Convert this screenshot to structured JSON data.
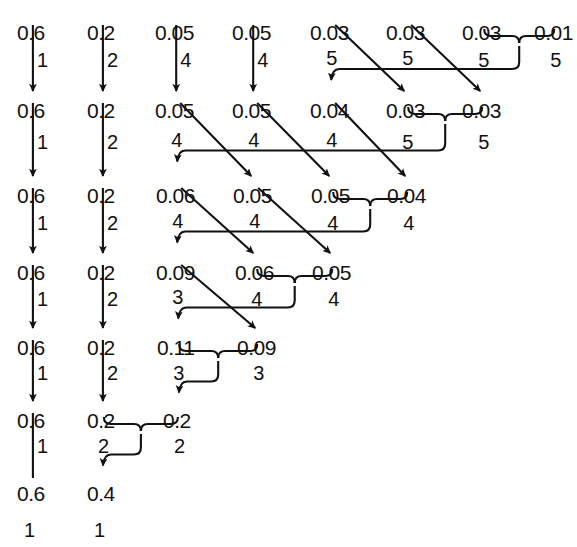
{
  "diagram": {
    "type": "huffman-reduction",
    "background": "#ffffff",
    "ink": "#111111",
    "width": 577,
    "height": 547
  },
  "chart_data": {
    "type": "diagram",
    "row_y": [
      22,
      100,
      185,
      262,
      337,
      410,
      483
    ],
    "rows": [
      {
        "index": 0,
        "y": 22,
        "values": [
          "0.6",
          "0.2",
          "0.05",
          "0.05",
          "0.03",
          "0.03",
          "0.03",
          "0.01"
        ],
        "x": [
          17,
          87,
          155,
          232,
          310,
          386,
          462,
          534
        ]
      },
      {
        "index": 1,
        "y": 100,
        "values": [
          "0.6",
          "0.2",
          "0.05",
          "0.05",
          "0.04",
          "0.03",
          "0.03"
        ],
        "x": [
          17,
          87,
          155,
          232,
          310,
          386,
          462
        ]
      },
      {
        "index": 2,
        "y": 185,
        "values": [
          "0.6",
          "0.2",
          "0.06",
          "0.05",
          "0.05",
          "0.04"
        ],
        "x": [
          17,
          87,
          156,
          233,
          311,
          387
        ]
      },
      {
        "index": 3,
        "y": 262,
        "values": [
          "0.6",
          "0.2",
          "0.09",
          "0.06",
          "0.05"
        ],
        "x": [
          17,
          87,
          156,
          235,
          312
        ]
      },
      {
        "index": 4,
        "y": 337,
        "values": [
          "0.6",
          "0.2",
          "0.11",
          "0.09"
        ],
        "x": [
          17,
          87,
          157,
          237
        ]
      },
      {
        "index": 5,
        "y": 410,
        "values": [
          "0.6",
          "0.2",
          "0.2"
        ],
        "x": [
          17,
          87,
          163
        ]
      },
      {
        "index": 6,
        "y": 483,
        "values": [
          "0.6",
          "0.4"
        ],
        "x": [
          17,
          87
        ]
      }
    ],
    "transitions": [
      {
        "from_row": 0,
        "to_row": 1,
        "straight_arrows": [
          {
            "column": 0,
            "label": "1"
          },
          {
            "column": 1,
            "label": "2"
          },
          {
            "column": 2,
            "label": "4"
          },
          {
            "column": 3,
            "label": "4"
          }
        ],
        "diagonal_arrows": [
          {
            "from_column": 4,
            "to_column": 5,
            "label": "5"
          },
          {
            "from_column": 5,
            "to_column": 6,
            "label": "5"
          }
        ],
        "merge": {
          "columns": [
            6,
            7
          ],
          "labels": [
            "5",
            "5"
          ],
          "target_column": 4
        }
      },
      {
        "from_row": 1,
        "to_row": 2,
        "straight_arrows": [
          {
            "column": 0,
            "label": "1"
          },
          {
            "column": 1,
            "label": "2"
          }
        ],
        "diagonal_arrows": [
          {
            "from_column": 2,
            "to_column": 3,
            "label": "4"
          },
          {
            "from_column": 3,
            "to_column": 4,
            "label": "4"
          },
          {
            "from_column": 4,
            "to_column": 5,
            "label": "4"
          }
        ],
        "merge": {
          "columns": [
            5,
            6
          ],
          "labels": [
            "5",
            "5"
          ],
          "target_column": 2
        }
      },
      {
        "from_row": 2,
        "to_row": 3,
        "straight_arrows": [
          {
            "column": 0,
            "label": "1"
          },
          {
            "column": 1,
            "label": "2"
          }
        ],
        "diagonal_arrows": [
          {
            "from_column": 2,
            "to_column": 3,
            "label": "4"
          },
          {
            "from_column": 3,
            "to_column": 4,
            "label": "4"
          }
        ],
        "merge": {
          "columns": [
            4,
            5
          ],
          "labels": [
            "4",
            "4"
          ],
          "target_column": 2
        }
      },
      {
        "from_row": 3,
        "to_row": 4,
        "straight_arrows": [
          {
            "column": 0,
            "label": "1"
          },
          {
            "column": 1,
            "label": "2"
          }
        ],
        "diagonal_arrows": [
          {
            "from_column": 2,
            "to_column": 3,
            "label": "3"
          }
        ],
        "merge": {
          "columns": [
            3,
            4
          ],
          "labels": [
            "4",
            "4"
          ],
          "target_column": 2
        }
      },
      {
        "from_row": 4,
        "to_row": 5,
        "straight_arrows": [
          {
            "column": 0,
            "label": "1"
          },
          {
            "column": 1,
            "label": "2"
          }
        ],
        "diagonal_arrows": [],
        "merge": {
          "columns": [
            2,
            3
          ],
          "labels": [
            "3",
            "3"
          ],
          "target_column": 2
        }
      },
      {
        "from_row": 5,
        "to_row": 6,
        "straight_arrows": [
          {
            "column": 0,
            "label": "1",
            "arrowhead": false
          }
        ],
        "diagonal_arrows": [],
        "merge": {
          "columns": [
            1,
            2
          ],
          "labels": [
            "2",
            "2"
          ],
          "target_column": 1
        }
      }
    ],
    "bottom_codes": {
      "y": 520,
      "values": [
        "1",
        "1"
      ],
      "x": [
        24,
        94
      ]
    }
  }
}
